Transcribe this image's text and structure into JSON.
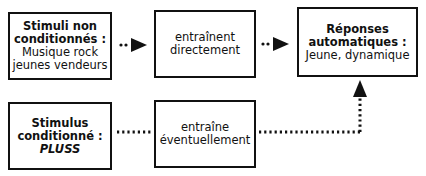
{
  "diagram": {
    "boxes": {
      "unconditioned_stimuli": {
        "title_line1": "Stimuli non",
        "title_line2": "conditionnés :",
        "body_line1": "Musique rock",
        "body_line2": "jeunes vendeurs"
      },
      "directly_causes": {
        "line1": "entraînent",
        "line2": "directement"
      },
      "automatic_responses": {
        "title_line1": "Réponses",
        "title_line2": "automatiques :",
        "body_line1": "Jeune, dynamique"
      },
      "conditioned_stimulus": {
        "title_line1": "Stimulus",
        "title_line2": "conditionné :",
        "brand": "PLUSS"
      },
      "eventually_causes": {
        "line1": "entraîne",
        "line2": "éventuellement"
      }
    },
    "colors": {
      "stroke": "#111111",
      "background": "#ffffff"
    }
  }
}
